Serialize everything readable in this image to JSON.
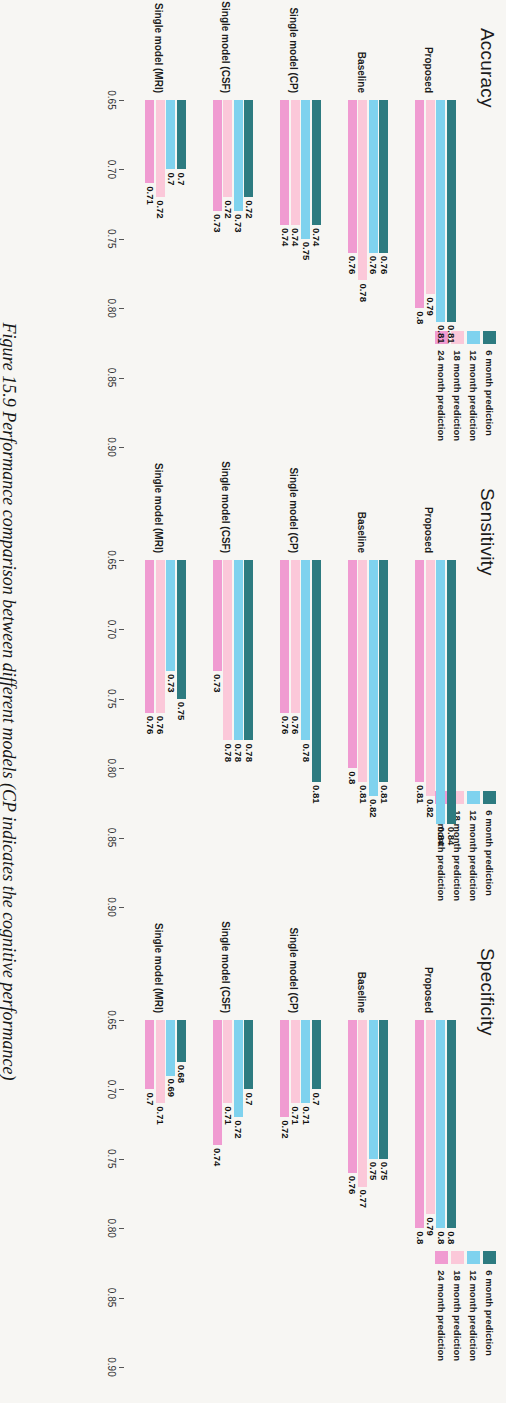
{
  "caption": "Figure 15.9   Performance comparison between different models (CP indicates the cognitive performance)",
  "legend": {
    "items": [
      {
        "label": "6 month prediction",
        "color": "#2d7b80"
      },
      {
        "label": "12 month prediction",
        "color": "#7fd2ee"
      },
      {
        "label": "18 month prediction",
        "color": "#fbc8d9"
      },
      {
        "label": "24 month prediction",
        "color": "#f09bd1"
      }
    ]
  },
  "axis": {
    "ticks": [
      "0.90",
      "0.85",
      "0.80",
      "0.75",
      "0.70",
      "0.65"
    ],
    "min": 0.65,
    "max": 0.9,
    "reversed": true
  },
  "categories": [
    "Proposed",
    "Baseline",
    "Single model (CP)",
    "Single model (CSF)",
    "Single model (MRI)"
  ],
  "chart_data": [
    {
      "type": "bar",
      "title": "Accuracy",
      "orientation": "horizontal",
      "xlabel": "",
      "ylabel": "",
      "xlim": [
        0.65,
        0.9
      ],
      "grid": false,
      "legend_position": "top-right",
      "categories": [
        "Proposed",
        "Baseline",
        "Single model (CP)",
        "Single model (CSF)",
        "Single model (MRI)"
      ],
      "tick_labels": [
        "0.90",
        "0.85",
        "0.80",
        "0.75",
        "0.70",
        "0.65"
      ],
      "series": [
        {
          "name": "6 month prediction",
          "color": "#2d7b80",
          "values": [
            0.81,
            0.76,
            0.74,
            0.72,
            0.7
          ]
        },
        {
          "name": "12 month prediction",
          "color": "#7fd2ee",
          "values": [
            0.81,
            0.76,
            0.75,
            0.73,
            0.7
          ]
        },
        {
          "name": "18 month prediction",
          "color": "#fbc8d9",
          "values": [
            0.79,
            0.78,
            0.74,
            0.72,
            0.72
          ]
        },
        {
          "name": "24 month prediction",
          "color": "#f09bd1",
          "values": [
            0.8,
            0.76,
            0.74,
            0.73,
            0.71
          ]
        }
      ],
      "data_labels": [
        [
          "0.81",
          "0.76",
          "0.74",
          "0.72",
          "0.7"
        ],
        [
          "0.81",
          "0.76",
          "0.75",
          "0.73",
          "0.7"
        ],
        [
          "0.79",
          "0.78",
          "0.74",
          "0.72",
          "0.72"
        ],
        [
          "0.8",
          "0.76",
          "0.74",
          "0.73",
          "0.71"
        ]
      ]
    },
    {
      "type": "bar",
      "title": "Sensitivity",
      "orientation": "horizontal",
      "xlabel": "",
      "ylabel": "",
      "xlim": [
        0.65,
        0.9
      ],
      "grid": false,
      "legend_position": "top-right",
      "categories": [
        "Proposed",
        "Baseline",
        "Single model (CP)",
        "Single model (CSF)",
        "Single model (MRI)"
      ],
      "tick_labels": [
        "0.90",
        "0.85",
        "0.80",
        "0.75",
        "0.70",
        "0.65"
      ],
      "series": [
        {
          "name": "6 month prediction",
          "color": "#2d7b80",
          "values": [
            0.84,
            0.81,
            0.81,
            0.78,
            0.75
          ]
        },
        {
          "name": "12 month prediction",
          "color": "#7fd2ee",
          "values": [
            0.84,
            0.82,
            0.78,
            0.78,
            0.73
          ]
        },
        {
          "name": "18 month prediction",
          "color": "#fbc8d9",
          "values": [
            0.82,
            0.81,
            0.76,
            0.78,
            0.76
          ]
        },
        {
          "name": "24 month prediction",
          "color": "#f09bd1",
          "values": [
            0.81,
            0.8,
            0.76,
            0.73,
            0.76
          ]
        }
      ],
      "data_labels": [
        [
          "0.84",
          "0.81",
          "0.81",
          "0.78",
          "0.75"
        ],
        [
          "0.84",
          "0.82",
          "0.78",
          "0.78",
          "0.73"
        ],
        [
          "0.82",
          "0.81",
          "0.76",
          "0.78",
          "0.76"
        ],
        [
          "0.81",
          "0.8",
          "0.76",
          "0.73",
          "0.76"
        ]
      ]
    },
    {
      "type": "bar",
      "title": "Specificity",
      "orientation": "horizontal",
      "xlabel": "",
      "ylabel": "",
      "xlim": [
        0.65,
        0.9
      ],
      "grid": false,
      "legend_position": "top-right",
      "categories": [
        "Proposed",
        "Baseline",
        "Single model (CP)",
        "Single model (CSF)",
        "Single model (MRI)"
      ],
      "tick_labels": [
        "0.90",
        "0.85",
        "0.80",
        "0.75",
        "0.70",
        "0.65"
      ],
      "series": [
        {
          "name": "6 month prediction",
          "color": "#2d7b80",
          "values": [
            0.8,
            0.75,
            0.7,
            0.7,
            0.68
          ]
        },
        {
          "name": "12 month prediction",
          "color": "#7fd2ee",
          "values": [
            0.8,
            0.75,
            0.71,
            0.72,
            0.69
          ]
        },
        {
          "name": "18 month prediction",
          "color": "#fbc8d9",
          "values": [
            0.79,
            0.77,
            0.71,
            0.71,
            0.71
          ]
        },
        {
          "name": "24 month prediction",
          "color": "#f09bd1",
          "values": [
            0.8,
            0.76,
            0.72,
            0.74,
            0.7
          ]
        }
      ],
      "data_labels": [
        [
          "0.8",
          "0.75",
          "0.7",
          "0.7",
          "0.68"
        ],
        [
          "0.8",
          "0.75",
          "0.71",
          "0.72",
          "0.69"
        ],
        [
          "0.79",
          "0.77",
          "0.71",
          "0.71",
          "0.71"
        ],
        [
          "0.8",
          "0.76",
          "0.72",
          "0.74",
          "0.7"
        ]
      ]
    }
  ]
}
